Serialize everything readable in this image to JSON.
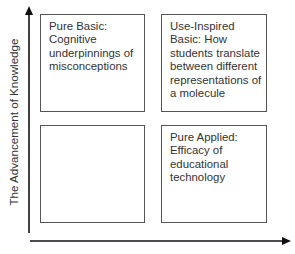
{
  "diagram": {
    "y_axis": {
      "label": "The Advancement of Knowledge",
      "direction": "up"
    },
    "x_axis": {
      "label": "",
      "direction": "right"
    },
    "quadrants": {
      "top_left": {
        "text": "Pure Basic:\nCognitive\nunderpinnings of\nmisconceptions"
      },
      "top_right": {
        "text": "Use-Inspired\nBasic: How\nstudents translate\nbetween different\nrepresentations of\na molecule"
      },
      "bottom_left": {
        "text": ""
      },
      "bottom_right": {
        "text": "Pure Applied:\nEfficacy of\neducational\ntechnology"
      }
    },
    "colors": {
      "axis": "#111111",
      "box_border": "#555555",
      "text": "#333333",
      "background": "#ffffff"
    }
  }
}
